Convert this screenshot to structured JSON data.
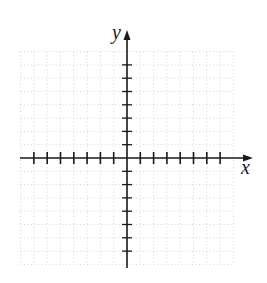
{
  "figure": {
    "type": "coordinate-plane",
    "x_axis_label": "x",
    "y_axis_label": "y",
    "grid": "dotted",
    "x_ticks_left_of_origin": 7,
    "x_ticks_right_of_origin": 7,
    "y_ticks_above_origin": 7,
    "y_ticks_below_origin": 7,
    "colors": {
      "axis": "#1a1a1a",
      "grid": "#c8c8c8",
      "background": "#ffffff"
    }
  }
}
